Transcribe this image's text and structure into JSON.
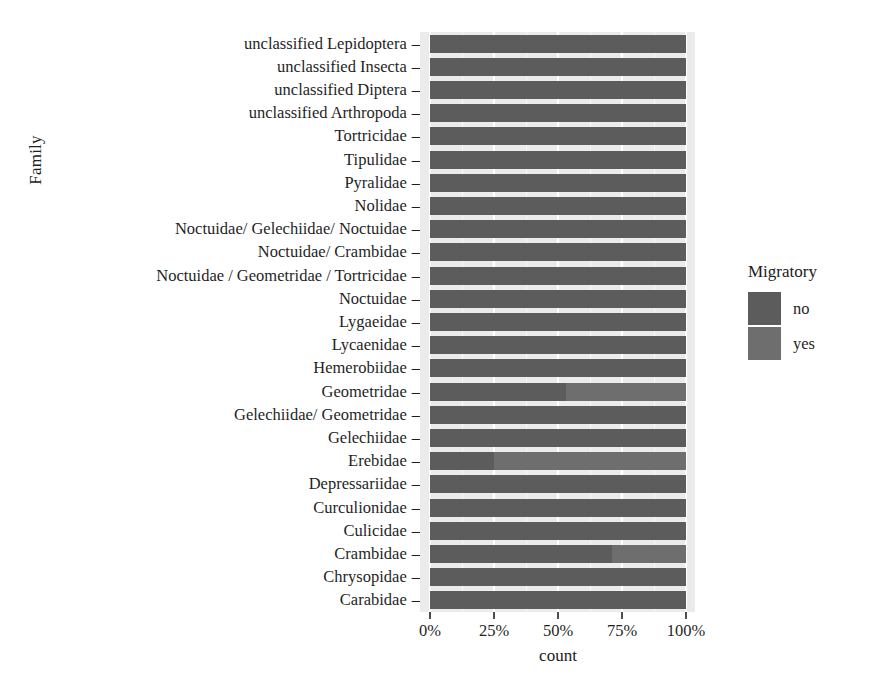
{
  "chart_data": {
    "type": "bar",
    "orientation": "horizontal",
    "stacked": true,
    "normalized": "100%",
    "title": "",
    "xlabel": "count",
    "ylabel": "Family",
    "xlim": [
      0,
      100
    ],
    "x_tick_labels": [
      "0%",
      "25%",
      "50%",
      "75%",
      "100%"
    ],
    "x_tick_values": [
      0,
      25,
      50,
      75,
      100
    ],
    "grid": true,
    "legend": {
      "title": "Migratory",
      "position": "right",
      "entries": [
        {
          "label": "no",
          "color": "#5c5c5c"
        },
        {
          "label": "yes",
          "color": "#6e6e6e"
        }
      ]
    },
    "categories": [
      "unclassified Lepidoptera",
      "unclassified Insecta",
      "unclassified Diptera",
      "unclassified Arthropoda",
      "Tortricidae",
      "Tipulidae",
      "Pyralidae",
      "Nolidae",
      "Noctuidae/ Gelechiidae/ Noctuidae",
      "Noctuidae/ Crambidae",
      "Noctuidae / Geometridae / Tortricidae",
      "Noctuidae",
      "Lygaeidae",
      "Lycaenidae",
      "Hemerobiidae",
      "Geometridae",
      "Gelechiidae/ Geometridae",
      "Gelechiidae",
      "Erebidae",
      "Depressariidae",
      "Curculionidae",
      "Culicidae",
      "Crambidae",
      "Chrysopidae",
      "Carabidae"
    ],
    "series": [
      {
        "name": "no",
        "values": [
          100,
          100,
          100,
          100,
          100,
          100,
          100,
          100,
          100,
          100,
          100,
          100,
          100,
          100,
          100,
          53,
          100,
          100,
          25,
          100,
          100,
          100,
          71,
          100,
          100
        ]
      },
      {
        "name": "yes",
        "values": [
          0,
          0,
          0,
          0,
          0,
          0,
          0,
          0,
          0,
          0,
          0,
          0,
          0,
          0,
          0,
          47,
          0,
          0,
          75,
          0,
          0,
          0,
          29,
          0,
          0
        ]
      }
    ]
  },
  "style": {
    "panel_background": "#ebebeb",
    "gridline_color": "#ffffff",
    "text_color": "#1f1f1f"
  }
}
